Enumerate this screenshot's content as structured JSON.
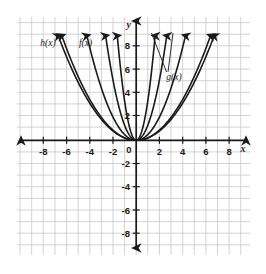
{
  "chart_data": {
    "type": "line",
    "title": "",
    "subtitle": "",
    "xlabel": "x",
    "ylabel": "y",
    "xlim": [
      -9.5,
      9.5
    ],
    "ylim": [
      -9.5,
      9.5
    ],
    "xticks": [
      -8,
      -6,
      -4,
      -2,
      2,
      4,
      6,
      8
    ],
    "yticks": [
      8,
      6,
      4,
      2,
      -2,
      -4,
      -6,
      -8
    ],
    "xtick_labels": [
      "-8",
      "-6",
      "-4",
      "-2",
      "2",
      "4",
      "6",
      "8"
    ],
    "ytick_labels": [
      "8",
      "6",
      "4",
      "2",
      "-2",
      "-4",
      "-6",
      "-8"
    ],
    "origin_label": "0",
    "grid": true,
    "grid_step": 1,
    "grid_color": "#c8c8cc",
    "axis_color": "#1a1a1a",
    "curve_color": "#1a1a1a",
    "legend_position": "inline-labels",
    "annotations": [
      {
        "text": "h(x)",
        "x": -5.9,
        "y": 8.1,
        "target": "curve_h"
      },
      {
        "text": "f(x)",
        "x": -2.8,
        "y": 8.1,
        "target": "curve_f"
      },
      {
        "text": "g(x)",
        "x": 2.9,
        "y": 5.9,
        "target": "curve_g"
      }
    ],
    "series": [
      {
        "name": "curve_h",
        "label": "h(x)",
        "form": "y = a*x^2",
        "a": 0.22,
        "x": [
          -6.4,
          -5.6,
          -4.8,
          -4.0,
          -3.2,
          -2.4,
          -1.6,
          -0.8,
          0,
          0.8,
          1.6,
          2.4,
          3.2,
          4.0,
          4.8,
          5.6,
          6.4
        ],
        "y": [
          9.0,
          6.9,
          5.07,
          3.52,
          2.25,
          1.27,
          0.56,
          0.14,
          0,
          0.14,
          0.56,
          1.27,
          2.25,
          3.52,
          5.07,
          6.9,
          9.0
        ]
      },
      {
        "name": "curve_f",
        "label": "f(x)",
        "form": "y = a*x^2",
        "a": 0.5,
        "x": [
          -4.25,
          -3.7,
          -3.2,
          -2.6,
          -2.1,
          -1.5,
          -1.0,
          -0.5,
          0,
          0.5,
          1.0,
          1.5,
          2.1,
          2.6,
          3.2,
          3.7,
          4.25
        ],
        "y": [
          9.0,
          6.85,
          5.12,
          3.38,
          2.2,
          1.13,
          0.5,
          0.13,
          0,
          0.13,
          0.5,
          1.13,
          2.2,
          3.38,
          5.12,
          6.85,
          9.0
        ]
      },
      {
        "name": "curve_inner_1",
        "label": "",
        "form": "y = a*x^2",
        "a": 1.3,
        "x": [
          -2.63,
          -2.2,
          -1.8,
          -1.4,
          -1.0,
          -0.6,
          -0.3,
          0,
          0.3,
          0.6,
          1.0,
          1.4,
          1.8,
          2.2,
          2.63
        ],
        "y": [
          9.0,
          6.29,
          4.21,
          2.55,
          1.3,
          0.47,
          0.12,
          0,
          0.12,
          0.47,
          1.3,
          2.55,
          4.21,
          6.29,
          9.0
        ]
      },
      {
        "name": "curve_inner_2",
        "label": "",
        "form": "y = a*x^2",
        "a": 3.4,
        "x": [
          -1.63,
          -1.35,
          -1.1,
          -0.85,
          -0.6,
          -0.35,
          -0.15,
          0,
          0.15,
          0.35,
          0.6,
          0.85,
          1.1,
          1.35,
          1.63
        ],
        "y": [
          9.0,
          6.2,
          4.11,
          2.46,
          1.22,
          0.42,
          0.08,
          0,
          0.08,
          0.42,
          1.22,
          2.46,
          4.11,
          6.2,
          9.0
        ]
      },
      {
        "name": "curve_g",
        "label": "g(x)",
        "form": "y = a*x^2",
        "a": 0.2,
        "x": [
          -6.7,
          -6.0,
          -5.2,
          -4.4,
          -3.6,
          -2.8,
          -2.0,
          -1.2,
          -0.5,
          0,
          0.5,
          1.2,
          2.0,
          2.8,
          3.6,
          4.4,
          5.2,
          6.0,
          6.7
        ],
        "y": [
          9.0,
          7.2,
          5.41,
          3.87,
          2.59,
          1.57,
          0.8,
          0.29,
          0.05,
          0,
          0.05,
          0.29,
          0.8,
          1.57,
          2.59,
          3.87,
          5.41,
          7.2,
          9.0
        ]
      }
    ],
    "arrow_tips": [
      {
        "series": "curve_h",
        "side": "left"
      },
      {
        "series": "curve_h",
        "side": "right"
      },
      {
        "series": "curve_f",
        "side": "left"
      },
      {
        "series": "curve_f",
        "side": "right"
      },
      {
        "series": "curve_inner_1",
        "side": "left"
      },
      {
        "series": "curve_inner_1",
        "side": "right"
      },
      {
        "series": "curve_inner_2",
        "side": "left"
      },
      {
        "series": "curve_inner_2",
        "side": "right"
      },
      {
        "series": "curve_g",
        "side": "left"
      },
      {
        "series": "curve_g",
        "side": "right"
      }
    ]
  }
}
